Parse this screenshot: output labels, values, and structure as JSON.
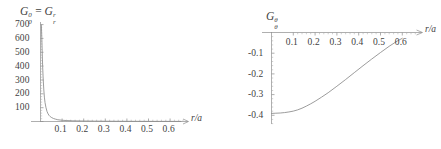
{
  "figures": [
    {
      "id": "left",
      "title_parts": {
        "base1": "G",
        "sup1": "0",
        "sub1": "0",
        "eq": "=",
        "base2": "G",
        "sup2": "r",
        "sub2": "r"
      },
      "title_text": "G₀⁰ = Gᵣʳ",
      "xlabel": "r/a",
      "ylabel": "",
      "xticks": [
        "0.1",
        "0.2",
        "0.3",
        "0.4",
        "0.5",
        "0.6"
      ],
      "yticks": [
        "100",
        "200",
        "300",
        "400",
        "500",
        "600",
        "700"
      ]
    },
    {
      "id": "right",
      "title_parts": {
        "base1": "G",
        "sup1": "θ",
        "sub1": "θ",
        "eq": "",
        "base2": "",
        "sup2": "",
        "sub2": ""
      },
      "title_text": "Gθθ",
      "xlabel": "r/a",
      "ylabel": "",
      "xticks": [
        "0.1",
        "0.2",
        "0.3",
        "0.4",
        "0.5",
        "0.6"
      ],
      "yticks": [
        "-0.1",
        "-0.2",
        "-0.3",
        "-0.4"
      ]
    }
  ],
  "chart_data": [
    {
      "type": "line",
      "id": "left-plot",
      "title": "G_0^0 = G_r^r",
      "xlabel": "r/a",
      "ylabel": "",
      "xlim": [
        0,
        0.66
      ],
      "ylim": [
        0,
        730
      ],
      "xticks": [
        0.1,
        0.2,
        0.3,
        0.4,
        0.5,
        0.6
      ],
      "yticks": [
        100,
        200,
        300,
        400,
        500,
        600,
        700
      ],
      "grid": false,
      "legend": "none",
      "axis_arrow_x": true,
      "description": "Sharply decaying curve from about 700 at r/a near 0.004, falling steeply to near zero by r/a = 0.08 and remaining flat thereafter",
      "series": [
        {
          "name": "G_0^0 = G_r^r",
          "x": [
            0.004,
            0.006,
            0.008,
            0.01,
            0.012,
            0.015,
            0.018,
            0.021,
            0.025,
            0.03,
            0.035,
            0.04,
            0.045,
            0.05,
            0.06,
            0.07,
            0.08,
            0.1,
            0.12,
            0.15,
            0.2,
            0.25,
            0.3,
            0.35,
            0.4,
            0.45,
            0.5,
            0.55,
            0.6,
            0.65
          ],
          "y": [
            705,
            610,
            500,
            400,
            325,
            238,
            178,
            138,
            104,
            74,
            56,
            44,
            36,
            30,
            22,
            17,
            13,
            9,
            7,
            5,
            3.5,
            2.6,
            2.1,
            1.7,
            1.4,
            1.2,
            1.0,
            0.9,
            0.8,
            0.7
          ]
        }
      ]
    },
    {
      "type": "line",
      "id": "right-plot",
      "title": "G_theta^theta",
      "xlabel": "r/a",
      "ylabel": "",
      "xlim": [
        0,
        0.66
      ],
      "ylim": [
        -0.44,
        0.0
      ],
      "xticks": [
        0.1,
        0.2,
        0.3,
        0.4,
        0.5,
        0.6
      ],
      "yticks": [
        -0.1,
        -0.2,
        -0.3,
        -0.4
      ],
      "grid": false,
      "legend": "none",
      "axis_arrow_x": true,
      "description": "Monotonically increasing curve starting near -0.387 at r/a = 0, nearly flat until r/a about 0.12, then rising steadily to about -0.03 at r/a = 0.6",
      "series": [
        {
          "name": "G_theta^theta",
          "x": [
            0.0,
            0.02,
            0.04,
            0.06,
            0.08,
            0.1,
            0.12,
            0.14,
            0.16,
            0.18,
            0.2,
            0.23,
            0.26,
            0.3,
            0.34,
            0.38,
            0.42,
            0.46,
            0.5,
            0.54,
            0.58,
            0.6
          ],
          "y": [
            -0.387,
            -0.386,
            -0.385,
            -0.383,
            -0.38,
            -0.376,
            -0.37,
            -0.362,
            -0.352,
            -0.341,
            -0.329,
            -0.309,
            -0.288,
            -0.257,
            -0.225,
            -0.192,
            -0.159,
            -0.127,
            -0.096,
            -0.066,
            -0.039,
            -0.028
          ]
        }
      ]
    }
  ]
}
